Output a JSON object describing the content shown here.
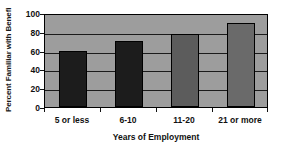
{
  "chart_data": {
    "type": "bar",
    "title": "",
    "categories": [
      "5 or less",
      "6-10",
      "11-20",
      "21 or more"
    ],
    "values": [
      60,
      70,
      78,
      89
    ],
    "series": [
      {
        "name": "Percent Familiar with Benefit",
        "values": [
          60,
          70,
          78,
          89
        ]
      }
    ],
    "xlabel": "Years of Employment",
    "ylabel": "Percent Familiar with Benefi",
    "ylim": [
      0,
      100
    ],
    "yticks": [
      0,
      20,
      40,
      60,
      80,
      100
    ],
    "ytick_labels": [
      "0",
      "20",
      "40",
      "60",
      "80",
      "100"
    ],
    "grid": true,
    "grid_axis": "y",
    "legend": false,
    "legend_position": "none",
    "plot_background_color": "#9d9d9d",
    "gridline_color": "#1b1b1b",
    "axis_color": "#000000",
    "bar_colors": [
      "#1c1c1c",
      "#1c1c1c",
      "#5c5c5c",
      "#6a6a6a"
    ]
  }
}
